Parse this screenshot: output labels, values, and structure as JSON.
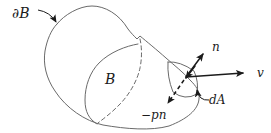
{
  "figure": {
    "type": "continuum-body-diagram",
    "labels": {
      "boundary": "∂B",
      "body": "B",
      "normal": "n",
      "velocity": "v",
      "area_element": "dA",
      "pressure_traction": "−pn"
    },
    "colors": {
      "bg": "#ffffff",
      "curve": "#6a6a6a",
      "ink": "#1b1b1b"
    }
  }
}
